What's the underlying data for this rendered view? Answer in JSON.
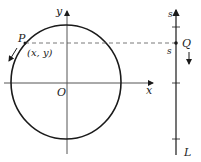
{
  "diagram": {
    "labels": {
      "y_axis": "y",
      "x_axis": "x",
      "origin": "O",
      "point_p": "P",
      "point_p_coords": "(x, y)",
      "point_q": "Q",
      "line_l": "L",
      "s_top": "s",
      "s_q": "s"
    },
    "colors": {
      "stroke": "#1a1a1a",
      "text": "#222222",
      "dashed": "#555555"
    }
  }
}
